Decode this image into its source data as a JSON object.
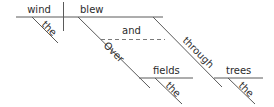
{
  "diagram": {
    "type": "sentence-diagram",
    "sentence_words": [
      "the",
      "wind",
      "blew",
      "over",
      "the",
      "fields",
      "and",
      "through",
      "the",
      "trees"
    ],
    "colors": {
      "line": "#5a5a5a",
      "dashed_line": "#7a7a7a",
      "text": "#2b2b2b",
      "background": "#ffffff"
    },
    "baseline": {
      "subject": "wind",
      "predicate": "blew"
    },
    "modifiers": {
      "subject_article": "the",
      "conjunction": "and",
      "preposition_1": "Over",
      "object_1": "fields",
      "object_1_article": "the",
      "preposition_2": "through",
      "object_2": "trees",
      "object_2_article": "the"
    }
  }
}
